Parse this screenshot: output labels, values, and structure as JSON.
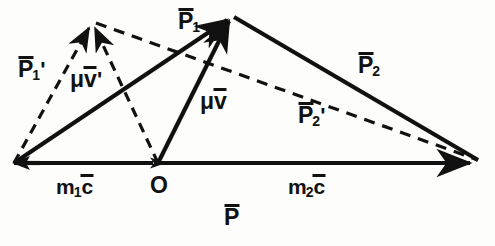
{
  "figure": {
    "type": "vector-diagram",
    "width": 495,
    "height": 246,
    "background_color": "#fdfdfb",
    "stroke_color": "#111111",
    "points": {
      "A": {
        "name": "left-vertex",
        "x": 14,
        "y": 163
      },
      "O": {
        "name": "origin-point",
        "x": 158,
        "y": 163,
        "label": "O"
      },
      "B": {
        "name": "right-vertex",
        "x": 484,
        "y": 163
      },
      "T": {
        "name": "top-solid-apex",
        "x": 232,
        "y": 15
      },
      "D": {
        "name": "top-dashed-apex",
        "x": 92,
        "y": 22
      }
    },
    "vectors": [
      {
        "id": "P1",
        "from": "A",
        "to": "T",
        "style": "solid",
        "label": "P",
        "sub": "1",
        "prime": false,
        "overbar": true
      },
      {
        "id": "muv",
        "from": "O",
        "to": "T",
        "style": "solid",
        "label": "μv",
        "sub": "",
        "prime": false,
        "overbar": true
      },
      {
        "id": "P2",
        "from": "T",
        "to": "B",
        "style": "solid",
        "label": "P",
        "sub": "2",
        "prime": false,
        "overbar": true
      },
      {
        "id": "m1c",
        "from": "A",
        "to": "O",
        "style": "solid",
        "label": "m",
        "sub": "1",
        "prime": false,
        "overbar": true
      },
      {
        "id": "m2c",
        "from": "O",
        "to": "B",
        "style": "solid",
        "label": "m",
        "sub": "2",
        "prime": false,
        "overbar": true
      },
      {
        "id": "P",
        "from": "A",
        "to": "B",
        "style": "solid",
        "label": "P",
        "sub": "",
        "prime": false,
        "overbar": true
      },
      {
        "id": "P1prime",
        "from": "A",
        "to": "D",
        "style": "dashed",
        "label": "P",
        "sub": "1",
        "prime": true,
        "overbar": true
      },
      {
        "id": "muvprime",
        "from": "O",
        "to": "D",
        "style": "dashed",
        "label": "μv",
        "sub": "",
        "prime": true,
        "overbar": true
      },
      {
        "id": "P2prime",
        "from": "D",
        "to": "B",
        "style": "dashed",
        "label": "P",
        "sub": "2",
        "prime": true,
        "overbar": true
      }
    ],
    "labels": [
      {
        "name": "label-P1-prime",
        "text": "P",
        "sub": "1",
        "prime": "'",
        "overbar": true,
        "x": 18,
        "y": 58,
        "size": "big"
      },
      {
        "name": "label-mu-v-prime",
        "text": "μv",
        "sub": "",
        "prime": "'",
        "overbar": true,
        "x": 70,
        "y": 68,
        "size": "big"
      },
      {
        "name": "label-P1",
        "text": "P",
        "sub": "1",
        "prime": "",
        "overbar": true,
        "x": 178,
        "y": 10,
        "size": "big"
      },
      {
        "name": "label-mu-v",
        "text": "μv",
        "sub": "",
        "prime": "",
        "overbar": true,
        "x": 200,
        "y": 90,
        "size": "big"
      },
      {
        "name": "label-P2",
        "text": "P",
        "sub": "2",
        "prime": "",
        "overbar": true,
        "x": 358,
        "y": 54,
        "size": "big"
      },
      {
        "name": "label-P2-prime",
        "text": "P",
        "sub": "2",
        "prime": "'",
        "overbar": true,
        "x": 298,
        "y": 104,
        "size": "big"
      },
      {
        "name": "label-m1-c",
        "text": "m",
        "sub": "1",
        "prime": "",
        "overbar": true,
        "tail": "c",
        "x": 56,
        "y": 176,
        "size": "mid"
      },
      {
        "name": "label-origin-O",
        "text": "O",
        "sub": "",
        "prime": "",
        "overbar": false,
        "x": 150,
        "y": 174,
        "size": "big"
      },
      {
        "name": "label-m2-c",
        "text": "m",
        "sub": "2",
        "prime": "",
        "overbar": true,
        "tail": "c",
        "x": 288,
        "y": 176,
        "size": "mid"
      },
      {
        "name": "label-P-total",
        "text": "P",
        "sub": "",
        "prime": "",
        "overbar": true,
        "x": 224,
        "y": 206,
        "size": "big"
      }
    ],
    "label_texts": {
      "P1_prime": "P̅₁'",
      "mu_v_prime": "μv̅'",
      "P1": "P̅₁",
      "mu_v": "μv̅",
      "P2": "P̅₂",
      "P2_prime": "P̅₂'",
      "m1_c": "m₁c̅",
      "origin": "O",
      "m2_c": "m₂c̅",
      "P_total": "P̅"
    },
    "glyphs": {
      "P": "P",
      "m": "m",
      "c": "c",
      "mu_v": "μv",
      "O": "O",
      "sub1": "1",
      "sub2": "2",
      "prime": "'"
    }
  }
}
